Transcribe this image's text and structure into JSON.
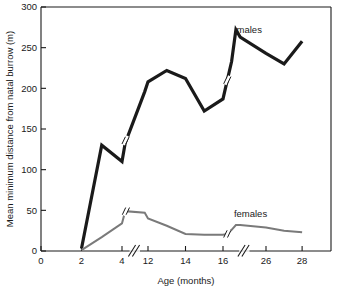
{
  "chart_data": {
    "type": "line",
    "title": "",
    "xlabel": "Age (months)",
    "ylabel": "Mean minimum distance from natal burrow (m)",
    "grid": false,
    "legend_position": "inline-annotations",
    "xlim": [
      0,
      29.6
    ],
    "ylim": [
      0,
      300
    ],
    "x_ticks": [
      0,
      2,
      4,
      12,
      14,
      16,
      26,
      28
    ],
    "x_tick_labels": [
      "0",
      "2",
      "4",
      "12",
      "14",
      "16",
      "26",
      "28"
    ],
    "y_ticks": [
      0,
      50,
      100,
      150,
      200,
      250,
      300
    ],
    "y_tick_labels": [
      "0",
      "50",
      "100",
      "150",
      "200",
      "250",
      "300"
    ],
    "axis_breaks": [
      {
        "axis": "x",
        "between": [
          4,
          12
        ]
      },
      {
        "axis": "x",
        "between": [
          16,
          26
        ]
      }
    ],
    "series": [
      {
        "name": "males",
        "color": "#1a1a1a",
        "width": 3.2,
        "label_x": 22.1,
        "label_y": 272,
        "x": [
          2,
          3,
          4,
          5,
          11,
          12,
          13,
          14,
          15,
          16,
          17,
          18,
          19,
          20,
          26,
          27,
          28
        ],
        "y": [
          3,
          130,
          110,
          133,
          196,
          208,
          222,
          212,
          172,
          187,
          210,
          233,
          272,
          263,
          243,
          230,
          258
        ]
      },
      {
        "name": "females",
        "color": "#7a7a7a",
        "width": 2.0,
        "label_x": 22.4,
        "label_y": 46,
        "x": [
          2,
          3,
          4,
          5,
          11,
          12,
          13,
          14,
          15,
          16,
          17,
          18,
          19,
          20,
          26,
          27,
          28
        ],
        "y": [
          1,
          17,
          34,
          49,
          47,
          40,
          31,
          21,
          20,
          20,
          21,
          26,
          32,
          32,
          29,
          25,
          23
        ]
      }
    ],
    "series_break_marks": [
      {
        "series": "males",
        "x": 5.1,
        "y": 136
      },
      {
        "series": "males",
        "x": 17.0,
        "y": 210
      },
      {
        "series": "females",
        "x": 5.2,
        "y": 49
      },
      {
        "series": "females",
        "x": 17.0,
        "y": 21
      }
    ]
  },
  "colors": {
    "axis": "#1a1a1a",
    "background": "#ffffff",
    "males": "#1a1a1a",
    "females": "#7a7a7a"
  }
}
